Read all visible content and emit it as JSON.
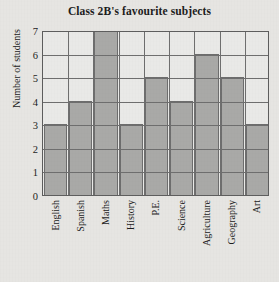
{
  "chart_data": {
    "type": "bar",
    "title": "Class 2B's favourite subjects",
    "xlabel": "",
    "ylabel": "Number of students",
    "categories": [
      "English",
      "Spanish",
      "Maths",
      "History",
      "P.E.",
      "Science",
      "Agriculture",
      "Geography",
      "Art"
    ],
    "values": [
      3,
      4,
      7,
      3,
      5,
      4,
      6,
      5,
      3
    ],
    "ylim": [
      0,
      7
    ],
    "ytick_labels": [
      "0",
      "1",
      "2",
      "3",
      "4",
      "5",
      "6",
      "7"
    ],
    "ytick_values": [
      0,
      1,
      2,
      3,
      4,
      5,
      6,
      7
    ],
    "grid": true,
    "legend": "none",
    "colors": {
      "bar_fill": "#a9a9a7",
      "bar_edge": "#6d6d6d",
      "plot_background": "#e9e9e7",
      "page_background": "#e6e5e2",
      "gridline": "#6e6e6e",
      "axis": "#5d5d5d",
      "text": "#1c1c1c"
    }
  }
}
